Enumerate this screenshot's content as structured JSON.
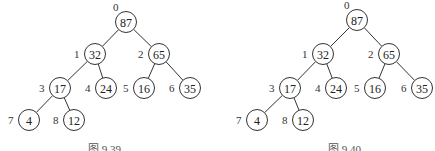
{
  "figures": [
    {
      "caption": "图 9.39",
      "caption_pos": {
        "x": 88,
        "y": 140
      },
      "nodes": [
        {
          "index": "0",
          "value": "87",
          "x": 126,
          "y": 22
        },
        {
          "index": "1",
          "value": "32",
          "x": 95,
          "y": 54
        },
        {
          "index": "2",
          "value": "65",
          "x": 159,
          "y": 54
        },
        {
          "index": "3",
          "value": "17",
          "x": 60,
          "y": 88
        },
        {
          "index": "4",
          "value": "24",
          "x": 106,
          "y": 88
        },
        {
          "index": "5",
          "value": "16",
          "x": 144,
          "y": 88
        },
        {
          "index": "6",
          "value": "35",
          "x": 190,
          "y": 88
        },
        {
          "index": "7",
          "value": "4",
          "x": 29,
          "y": 120
        },
        {
          "index": "8",
          "value": "12",
          "x": 74,
          "y": 120
        }
      ]
    },
    {
      "caption": "图 9.40",
      "caption_pos": {
        "x": 328,
        "y": 140
      },
      "nodes": [
        {
          "index": "0",
          "value": "87",
          "x": 357,
          "y": 20
        },
        {
          "index": "1",
          "value": "32",
          "x": 323,
          "y": 54
        },
        {
          "index": "2",
          "value": "65",
          "x": 389,
          "y": 54
        },
        {
          "index": "3",
          "value": "17",
          "x": 290,
          "y": 88
        },
        {
          "index": "4",
          "value": "24",
          "x": 336,
          "y": 88
        },
        {
          "index": "5",
          "value": "16",
          "x": 375,
          "y": 88
        },
        {
          "index": "6",
          "value": "35",
          "x": 422,
          "y": 88
        },
        {
          "index": "7",
          "value": "4",
          "x": 257,
          "y": 120
        },
        {
          "index": "8",
          "value": "12",
          "x": 303,
          "y": 120
        }
      ]
    }
  ],
  "edges": [
    [
      0,
      1
    ],
    [
      0,
      2
    ],
    [
      1,
      3
    ],
    [
      1,
      4
    ],
    [
      2,
      5
    ],
    [
      2,
      6
    ],
    [
      3,
      7
    ],
    [
      3,
      8
    ]
  ],
  "node_radius": 10.5
}
